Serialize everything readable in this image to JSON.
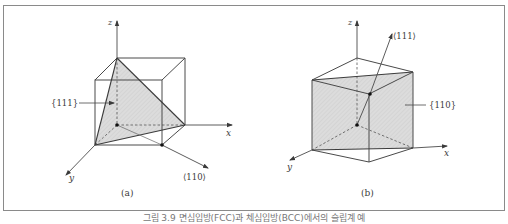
{
  "figure": {
    "frame": {
      "x": 3,
      "y": 5,
      "width": 502,
      "height": 206,
      "stroke": "#8a8a8a"
    },
    "colors": {
      "edge": "#4a4a4a",
      "hidden": "#555555",
      "fill": "#d9d9d9",
      "axis": "#4a4a4a"
    },
    "caption": "그림 3.9  면심입방(FCC)과 체심입방(BCC)에서의 슬립계 예",
    "panel_a": {
      "label": "(a)",
      "axes": {
        "x": "x",
        "y": "y",
        "z": "z"
      },
      "plane_label": "{111}",
      "direction_label": "⟨110⟩"
    },
    "panel_b": {
      "label": "(b)",
      "axes": {
        "x": "x",
        "y": "y",
        "z": "z"
      },
      "plane_label": "{110}",
      "direction_label": "⟨111⟩"
    }
  }
}
